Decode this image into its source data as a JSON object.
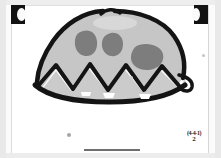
{
  "document": {
    "type": "scanned-paper-drawing",
    "media": "crayon-and-marker on white paper",
    "page_background": "#ffffff",
    "scanner_bed_color": "#e9e9e9"
  },
  "artwork": {
    "title": "dome with spots and zigzag base",
    "description": "A hand-drawn rounded dome or hill shape filled light gray, with three darker gray oval blobs on the upper body and a row of four black zigzag peaks across the lower portion, all outlined in thick black marker.",
    "colors": {
      "outline": "#141414",
      "body_fill": "#c6c6c6",
      "spot_fill": "#7d7d7d",
      "highlight": "#d8d8d8"
    },
    "elements": [
      {
        "name": "dome-outline",
        "kind": "stroke",
        "color": "#141414"
      },
      {
        "name": "dome-body",
        "kind": "fill",
        "color": "#c6c6c6"
      },
      {
        "name": "spot-left",
        "kind": "blob",
        "color": "#7d7d7d"
      },
      {
        "name": "spot-center",
        "kind": "blob",
        "color": "#7d7d7d"
      },
      {
        "name": "spot-right",
        "kind": "blob",
        "color": "#7d7d7d"
      },
      {
        "name": "zigzag-peaks",
        "kind": "stroke",
        "color": "#141414",
        "peak_count": 4
      },
      {
        "name": "baseline-curve",
        "kind": "stroke",
        "color": "#141414"
      },
      {
        "name": "right-tail-flap",
        "kind": "stroke",
        "color": "#141414"
      },
      {
        "name": "top-notch",
        "kind": "stroke",
        "color": "#141414"
      }
    ]
  },
  "annotation": {
    "line_one": "(4-4-1)",
    "line_two": "2"
  },
  "artifacts": {
    "binder_clip_left": "binder-clip",
    "binder_clip_right": "binder-clip",
    "bottom_bar": "scan-edge-bar",
    "specks": [
      "speck-lower-left",
      "speck-right-edge",
      "speck-mid"
    ]
  }
}
